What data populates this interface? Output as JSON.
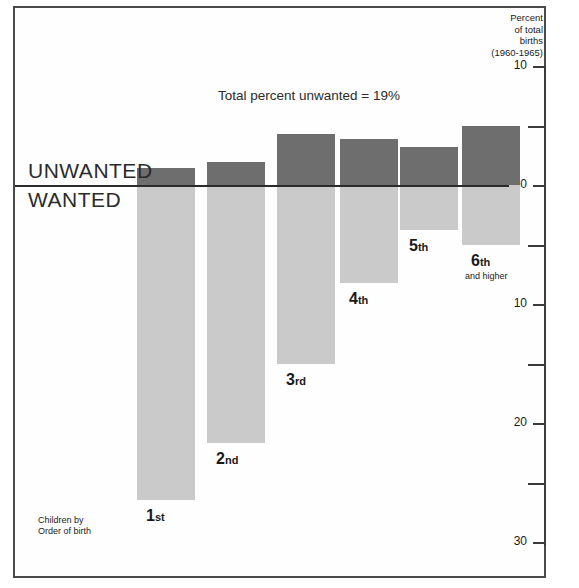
{
  "figure": {
    "total_note": "Total percent unwanted = 19%",
    "corner_caption_line1": "Children by",
    "corner_caption_line2": "Order of birth",
    "label_unwanted": "UNWANTED",
    "label_wanted": "WANTED",
    "top_cropped_text": "",
    "colors": {
      "unwanted": "#6e6e6e",
      "wanted": "#cacaca",
      "frame": "#4a4a4a",
      "zero_line": "#2b2b2b",
      "text": "#1a1a1a"
    }
  },
  "axis": {
    "title_line1": "Percent",
    "title_line2": "of total",
    "title_line3": "births",
    "title_line4": "(1960-1965)",
    "tick_labels": [
      "10",
      "0",
      "10",
      "20",
      "30"
    ],
    "tick_values": [
      -10,
      0,
      10,
      20,
      30
    ],
    "minor_tick_values": [
      -5,
      5,
      15,
      25
    ],
    "position": "right"
  },
  "chart_data": {
    "type": "bar",
    "title": "Total percent unwanted = 19%",
    "subtitle": "",
    "xlabel": "Children by Order of birth",
    "ylabel": "Percent of total births (1960-1965)",
    "ylim": [
      30,
      -10
    ],
    "y_inverted": true,
    "grid": false,
    "legend_position": "left-inline",
    "orientation": "vertical-diverging",
    "categories": [
      "1st",
      "2nd",
      "3rd",
      "4th",
      "5th",
      "6th and higher"
    ],
    "category_labels": [
      {
        "num": "1",
        "suffix": "st",
        "sub": ""
      },
      {
        "num": "2",
        "suffix": "nd",
        "sub": ""
      },
      {
        "num": "3",
        "suffix": "rd",
        "sub": ""
      },
      {
        "num": "4",
        "suffix": "th",
        "sub": ""
      },
      {
        "num": "5",
        "suffix": "th",
        "sub": ""
      },
      {
        "num": "6",
        "suffix": "th",
        "sub": "and higher"
      }
    ],
    "series": [
      {
        "name": "UNWANTED",
        "color": "#6e6e6e",
        "direction": "up",
        "values": [
          1.4,
          1.9,
          4.3,
          3.9,
          3.2,
          5.0
        ]
      },
      {
        "name": "WANTED",
        "color": "#cacaca",
        "direction": "down",
        "values": [
          26.5,
          21.7,
          15.0,
          8.2,
          3.8,
          5.0
        ]
      }
    ],
    "annotations": [
      {
        "text": "Total percent unwanted = 19%",
        "x": 0.45,
        "y": -8.2
      }
    ]
  },
  "geometry": {
    "zero_y": 185,
    "px_per_unit": 11.9,
    "bar_width": 58,
    "bar_lefts": [
      137,
      207,
      277,
      340,
      400,
      462
    ]
  }
}
